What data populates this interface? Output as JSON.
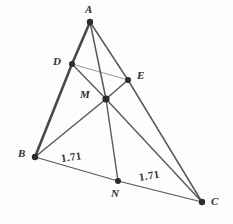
{
  "figure": {
    "background_color": "#fdfdfc",
    "stroke_color": "#4a4a52",
    "thick_stroke_color": "#3a3a42",
    "vertex_color": "#2b2b31",
    "label_color": "#2e2e33",
    "width": 233,
    "height": 224
  },
  "points": [
    {
      "id": "A",
      "label": "A",
      "x": 90,
      "y": 22,
      "label_x": 85,
      "label_y": 4,
      "radius": 3.2
    },
    {
      "id": "D",
      "label": "D",
      "x": 72,
      "y": 64,
      "label_x": 53,
      "label_y": 56,
      "radius": 3.0
    },
    {
      "id": "E",
      "label": "E",
      "x": 128,
      "y": 80,
      "label_x": 137,
      "label_y": 70,
      "radius": 3.0
    },
    {
      "id": "M",
      "label": "M",
      "x": 106,
      "y": 99,
      "label_x": 80,
      "label_y": 89,
      "radius": 3.6
    },
    {
      "id": "B",
      "label": "B",
      "x": 35,
      "y": 157,
      "label_x": 18,
      "label_y": 148,
      "radius": 3.2
    },
    {
      "id": "N",
      "label": "N",
      "x": 118,
      "y": 181,
      "label_x": 111,
      "label_y": 188,
      "radius": 3.0
    },
    {
      "id": "C",
      "label": "C",
      "x": 202,
      "y": 202,
      "label_x": 211,
      "label_y": 196,
      "radius": 3.2
    }
  ],
  "segments": [
    {
      "id": "AD",
      "from": "A",
      "to": "D",
      "width": 2.6
    },
    {
      "id": "DB",
      "from": "D",
      "to": "B",
      "width": 2.6
    },
    {
      "id": "AM",
      "from": "A",
      "to": "M",
      "width": 1.5
    },
    {
      "id": "AE",
      "from": "A",
      "to": "E",
      "width": 1.5
    },
    {
      "id": "EC",
      "from": "E",
      "to": "C",
      "width": 1.5
    },
    {
      "id": "DE",
      "from": "D",
      "to": "E",
      "width": 0.9
    },
    {
      "id": "DM",
      "from": "D",
      "to": "M",
      "width": 1.3
    },
    {
      "id": "MC",
      "from": "M",
      "to": "C",
      "width": 1.4
    },
    {
      "id": "BM",
      "from": "B",
      "to": "M",
      "width": 1.4
    },
    {
      "id": "ME",
      "from": "M",
      "to": "E",
      "width": 1.4
    },
    {
      "id": "MN",
      "from": "M",
      "to": "N",
      "width": 1.4
    },
    {
      "id": "BN",
      "from": "B",
      "to": "N",
      "width": 1.2
    },
    {
      "id": "NC",
      "from": "N",
      "to": "C",
      "width": 1.2
    }
  ],
  "measurements": [
    {
      "id": "len-BN",
      "text": "1.71",
      "x": 61,
      "y": 153,
      "on_segment": "BN",
      "rotation": -8
    },
    {
      "id": "len-NC",
      "text": "1.71",
      "x": 139,
      "y": 172,
      "on_segment": "NC",
      "rotation": -9
    }
  ]
}
